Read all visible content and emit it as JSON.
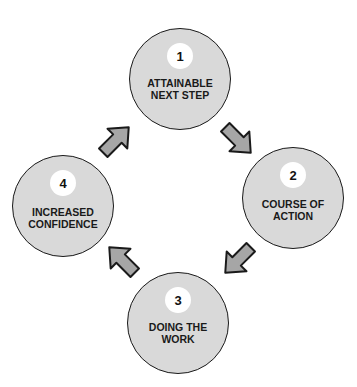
{
  "diagram": {
    "type": "cycle",
    "colors": {
      "node_fill": "#d9d9d9",
      "node_stroke": "#1a1a1a",
      "badge_fill": "#ffffff",
      "arrow_fill": "#a6a6a6",
      "arrow_stroke": "#1a1a1a"
    },
    "nodes": [
      {
        "number": "1",
        "label": "ATTAINABLE NEXT STEP"
      },
      {
        "number": "2",
        "label": "COURSE OF ACTION"
      },
      {
        "number": "3",
        "label": "DOING THE WORK"
      },
      {
        "number": "4",
        "label": "INCREASED CONFIDENCE"
      }
    ],
    "edges": [
      {
        "from": "1",
        "to": "2",
        "direction": "down-right"
      },
      {
        "from": "2",
        "to": "3",
        "direction": "down-left"
      },
      {
        "from": "3",
        "to": "4",
        "direction": "up-left"
      },
      {
        "from": "4",
        "to": "1",
        "direction": "up-right"
      }
    ]
  }
}
